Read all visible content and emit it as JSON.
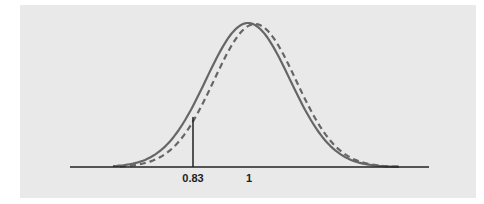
{
  "chart_data": {
    "type": "line",
    "title": "",
    "xlabel": "",
    "ylabel": "",
    "x_tick_labels": [
      "0.83",
      "1"
    ],
    "series": [
      {
        "name": "solid curve",
        "style": "solid",
        "distribution": "normal",
        "center": 1.0,
        "color": "#666666"
      },
      {
        "name": "dashed curve",
        "style": "dashed",
        "distribution": "normal",
        "center": 1.02,
        "color": "#666666"
      }
    ],
    "annotations": [
      {
        "type": "vertical-line",
        "x": 0.83,
        "label": "0.83"
      }
    ],
    "grid": false,
    "legend": "none"
  },
  "labels": {
    "tick_a": "0.83",
    "tick_b": "1"
  },
  "colors": {
    "background": "#e9e9e9",
    "curve": "#666666",
    "axis": "#222222"
  }
}
